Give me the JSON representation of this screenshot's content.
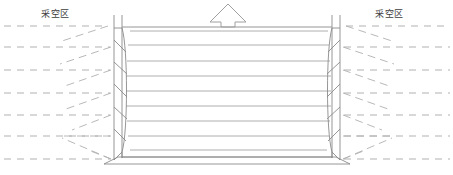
{
  "diagram": {
    "type": "mining-panel-schematic",
    "background_color": "#ffffff",
    "line_color": "#808080",
    "dash_color": "#a8a8a8",
    "text_color": "#3c3c3c"
  },
  "labels": {
    "goaf_left": "采空区",
    "goaf_right": "采空区"
  },
  "arrow": {
    "name": "advance-direction-arrow",
    "direction": "up",
    "style": "hollow-outline",
    "cx": 228,
    "tip_y": 4,
    "base_y": 26,
    "head_half_width": 18,
    "shaft_half_width": 7
  },
  "panel": {
    "name": "working-face-panel",
    "left_x": 122,
    "right_x": 332,
    "top_y": 27,
    "bottom_y": 157,
    "strata_count": 8,
    "strata_y": [
      31,
      45,
      61,
      76,
      91,
      106,
      121,
      136,
      150
    ]
  },
  "pillars": {
    "left": {
      "outer_x": 114,
      "inner_x": 122,
      "top_y": 15,
      "bottom_y": 162,
      "bulge": 6
    },
    "right": {
      "outer_x": 340,
      "inner_x": 332,
      "top_y": 15,
      "bottom_y": 162,
      "bulge": 6
    }
  },
  "base_slab": {
    "name": "floor-slab",
    "left_x": 104,
    "right_x": 350,
    "top_y": 157,
    "bottom_y": 164,
    "inset": 14
  },
  "goaf_left": {
    "dash_rows_y": [
      26,
      47,
      70,
      93,
      115,
      136,
      159
    ],
    "dash_x_start": 4,
    "dash_x_end": 108,
    "fracture_lines": [
      {
        "x1": 108,
        "y1": 26,
        "x2": 62,
        "y2": 40
      },
      {
        "x1": 110,
        "y1": 47,
        "x2": 60,
        "y2": 63
      },
      {
        "x1": 110,
        "y1": 70,
        "x2": 62,
        "y2": 86
      },
      {
        "x1": 110,
        "y1": 93,
        "x2": 66,
        "y2": 108
      },
      {
        "x1": 110,
        "y1": 115,
        "x2": 72,
        "y2": 129
      },
      {
        "x1": 110,
        "y1": 136,
        "x2": 60,
        "y2": 136
      },
      {
        "x1": 110,
        "y1": 159,
        "x2": 62,
        "y2": 137
      }
    ]
  },
  "goaf_right": {
    "dash_rows_y": [
      26,
      47,
      70,
      93,
      115,
      136,
      159
    ],
    "dash_x_start": 346,
    "dash_x_end": 450,
    "fracture_lines": [
      {
        "x1": 346,
        "y1": 26,
        "x2": 392,
        "y2": 40
      },
      {
        "x1": 344,
        "y1": 47,
        "x2": 394,
        "y2": 63
      },
      {
        "x1": 344,
        "y1": 70,
        "x2": 392,
        "y2": 86
      },
      {
        "x1": 344,
        "y1": 93,
        "x2": 388,
        "y2": 108
      },
      {
        "x1": 344,
        "y1": 115,
        "x2": 382,
        "y2": 129
      },
      {
        "x1": 344,
        "y1": 136,
        "x2": 394,
        "y2": 136
      },
      {
        "x1": 344,
        "y1": 159,
        "x2": 392,
        "y2": 137
      }
    ]
  }
}
